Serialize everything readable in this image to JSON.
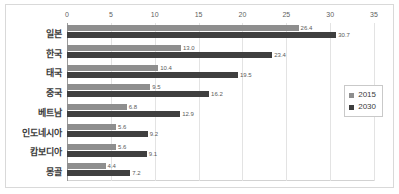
{
  "chart_data": {
    "type": "bar",
    "orientation": "horizontal",
    "title": "",
    "subtitle": "",
    "xlabel": "",
    "ylabel": "",
    "xlim": [
      0,
      35
    ],
    "xticks": [
      "0",
      "5",
      "10",
      "15",
      "20",
      "25",
      "30",
      "35"
    ],
    "grid": true,
    "legend_position": "right",
    "categories": [
      "일본",
      "한국",
      "태국",
      "중국",
      "베트남",
      "인도네시아",
      "캄보디아",
      "몽골"
    ],
    "series": [
      {
        "name": "2015",
        "color": "#8e8e8e",
        "values": [
          26.4,
          13.0,
          10.4,
          9.5,
          6.8,
          5.6,
          5.6,
          4.4
        ],
        "labels": [
          "26.4",
          "13.0",
          "10.4",
          "9.5",
          "6.8",
          "5.6",
          "5.6",
          "4.4"
        ]
      },
      {
        "name": "2030",
        "color": "#3f3f3f",
        "values": [
          30.7,
          23.4,
          19.5,
          16.2,
          12.9,
          9.2,
          9.1,
          7.2
        ],
        "labels": [
          "30.7",
          "23.4",
          "19.5",
          "16.2",
          "12.9",
          "9.2",
          "9.1",
          "7.2"
        ]
      }
    ]
  },
  "legend": {
    "items": [
      {
        "label": "2015",
        "color": "#8e8e8e"
      },
      {
        "label": "2030",
        "color": "#3f3f3f"
      }
    ]
  }
}
